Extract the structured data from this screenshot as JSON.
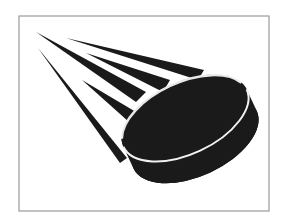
{
  "image": {
    "subject": "hockey puck in motion",
    "description": "Black hockey puck with white rim line flying toward the lower right, trailed by five tapered black speed lines, inside a thin gray rectangular frame",
    "icons": [
      "hockey-puck-icon",
      "speed-lines-icon"
    ],
    "colors": {
      "background": "#ffffff",
      "puck": "#1a1a1a",
      "rim_line": "#f2f2f2",
      "speed_lines": "#1a1a1a",
      "frame": "#9a9a9a"
    }
  }
}
